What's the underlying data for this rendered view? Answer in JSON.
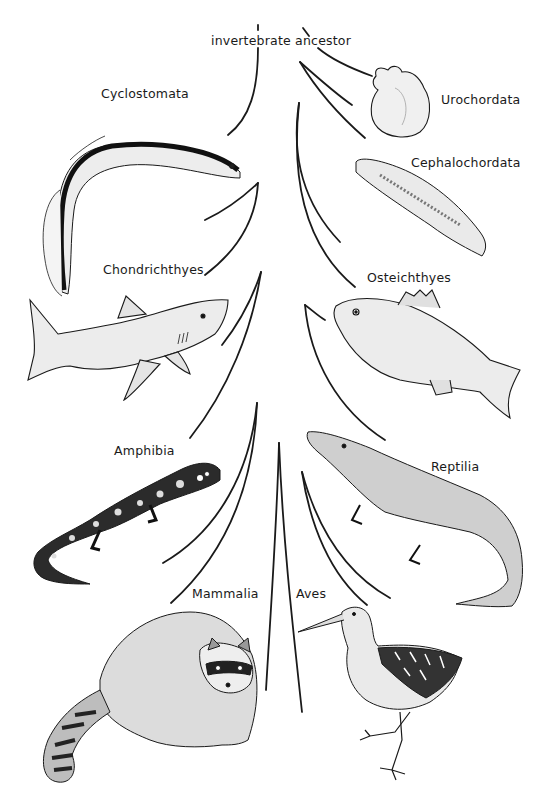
{
  "diagram": {
    "type": "phylogenetic-tree",
    "root_label": "invertebrate ancestor",
    "colors": {
      "background": "#ffffff",
      "ink": "#1a1a1a"
    },
    "taxa": [
      {
        "id": "cyclostomata",
        "label": "Cyclostomata",
        "animal": "lamprey"
      },
      {
        "id": "urochordata",
        "label": "Urochordata",
        "animal": "sea squirt"
      },
      {
        "id": "cephalochordata",
        "label": "Cephalochordata",
        "animal": "lancelet"
      },
      {
        "id": "chondrichthyes",
        "label": "Chondrichthyes",
        "animal": "shark"
      },
      {
        "id": "osteichthyes",
        "label": "Osteichthyes",
        "animal": "bony fish"
      },
      {
        "id": "amphibia",
        "label": "Amphibia",
        "animal": "salamander"
      },
      {
        "id": "reptilia",
        "label": "Reptilia",
        "animal": "alligator"
      },
      {
        "id": "mammalia",
        "label": "Mammalia",
        "animal": "raccoon"
      },
      {
        "id": "aves",
        "label": "Aves",
        "animal": "rail bird"
      }
    ]
  }
}
